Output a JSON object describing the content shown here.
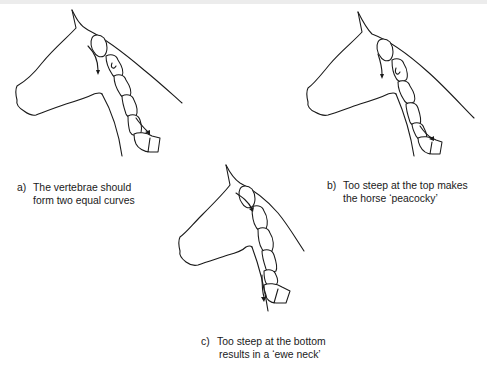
{
  "figures": [
    {
      "id": "a",
      "label": "a)",
      "caption_line1": "The vertebrae should",
      "caption_line2": "form two equal curves",
      "variant": "equal-curves"
    },
    {
      "id": "b",
      "label": "b)",
      "caption_line1": "Too steep at the top makes",
      "caption_line2": "the horse ‘peacocky’",
      "variant": "steep-top"
    },
    {
      "id": "c",
      "label": "c)",
      "caption_line1": "Too steep at the bottom",
      "caption_line2": "results in a ‘ewe neck’",
      "variant": "steep-bottom"
    }
  ],
  "colors": {
    "line": "#1a1a1a",
    "background": "#ffffff",
    "top_bar": "#ececec"
  }
}
